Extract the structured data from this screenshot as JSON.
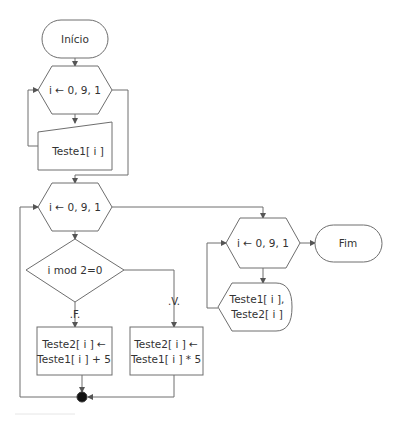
{
  "diagram": {
    "type": "flowchart",
    "nodes": {
      "start": {
        "shape": "terminal",
        "label": "Início"
      },
      "loop1": {
        "shape": "hexagon-loop",
        "label": "i ← 0,  9, 1"
      },
      "input1": {
        "shape": "manual-input",
        "label": "Teste1[ i ]"
      },
      "loop2": {
        "shape": "hexagon-loop",
        "label": "i ← 0,  9, 1"
      },
      "decision": {
        "shape": "diamond",
        "label": "i mod  2=0"
      },
      "false_label": ".F.",
      "true_label": ".V.",
      "process_false": {
        "shape": "process",
        "line1": "Teste2[ i ] ←",
        "line2": "Teste1[ i ] + 5"
      },
      "process_true": {
        "shape": "process",
        "line1": "Teste2[ i ] ←",
        "line2": "Teste1[ i ] * 5"
      },
      "connector": {
        "shape": "junction-dot"
      },
      "loop3": {
        "shape": "hexagon-loop",
        "label": "i ← 0,  9, 1"
      },
      "display": {
        "shape": "display",
        "line1": "Teste1[ i ],",
        "line2": "Teste2[ i ]"
      },
      "end": {
        "shape": "terminal",
        "label": "Fim"
      }
    },
    "colors": {
      "stroke": "#6e6e6e",
      "text": "#333333",
      "background": "#ffffff",
      "junction": "#111111"
    }
  }
}
